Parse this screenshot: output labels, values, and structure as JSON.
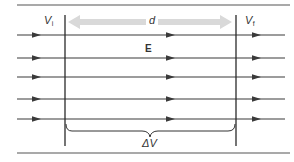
{
  "diagram": {
    "colors": {
      "line": "#3a3a3a",
      "arrow_head": "#3a3a3a",
      "plate": "#2a2a2a",
      "distance_arrow": "#d9d9d9",
      "text": "#333333",
      "frame_rule": "#555555"
    },
    "labels": {
      "initial_potential": {
        "main": "V",
        "sub": "i"
      },
      "final_potential": {
        "main": "V",
        "sub": "f"
      },
      "distance": "d",
      "field": "E",
      "potential_difference": "ΔV"
    },
    "field_lines": [
      {
        "y": 35
      },
      {
        "y": 58
      },
      {
        "y": 77
      },
      {
        "y": 99
      },
      {
        "y": 119
      }
    ],
    "arrowhead_x": [
      38,
      172,
      258
    ],
    "plates": {
      "left_x": 65,
      "right_x": 236,
      "top_y": 15,
      "bottom_y": 146
    }
  }
}
